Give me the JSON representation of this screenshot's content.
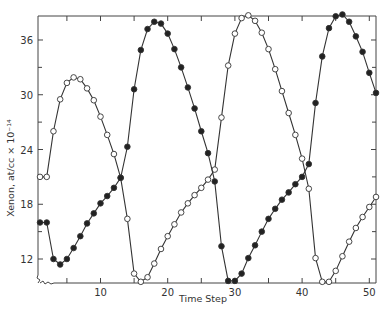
{
  "chart_data": {
    "type": "line",
    "title": "",
    "xlabel": "Time Step",
    "ylabel": "Xenon, at/cc × 10⁻¹⁴",
    "xlim": [
      0.7,
      51
    ],
    "ylim": [
      9.37,
      38.63
    ],
    "x_ticks": [
      10,
      20,
      30,
      40,
      50
    ],
    "x_minor_ticks": [
      5,
      15,
      25,
      35,
      45
    ],
    "y_ticks": [
      12,
      18,
      24,
      30,
      36
    ],
    "y_minor_ticks": [
      15,
      21,
      27,
      33
    ],
    "grid": false,
    "legend": null,
    "axis_break_marker": true,
    "x": [
      1,
      2,
      3,
      4,
      5,
      6,
      7,
      8,
      9,
      10,
      11,
      12,
      13,
      14,
      15,
      16,
      17,
      18,
      19,
      20,
      21,
      22,
      23,
      24,
      25,
      26,
      27,
      28,
      29,
      30,
      31,
      32,
      33,
      34,
      35,
      36,
      37,
      38,
      39,
      40,
      41,
      42,
      43,
      44,
      45,
      46,
      47,
      48,
      49,
      50,
      51
    ],
    "series": [
      {
        "name": "open circles",
        "marker": "open-circle",
        "values": [
          21.0,
          21.0,
          26.0,
          29.5,
          31.3,
          31.9,
          31.7,
          30.7,
          29.4,
          27.6,
          25.6,
          23.5,
          20.9,
          16.4,
          10.4,
          9.5,
          10.0,
          11.5,
          13.1,
          14.5,
          15.8,
          17.1,
          18.1,
          19.0,
          19.8,
          20.7,
          21.8,
          27.5,
          33.2,
          36.7,
          38.4,
          38.7,
          38.1,
          36.8,
          35.0,
          32.8,
          30.4,
          28.0,
          25.6,
          23.0,
          19.7,
          12.1,
          9.5,
          9.5,
          10.7,
          12.3,
          13.9,
          15.4,
          16.6,
          17.7,
          18.8
        ]
      },
      {
        "name": "filled circles",
        "marker": "filled-circle",
        "values": [
          16.0,
          16.0,
          12.0,
          11.4,
          12.0,
          13.2,
          14.5,
          15.9,
          17.0,
          18.1,
          18.9,
          19.8,
          20.9,
          24.3,
          30.6,
          34.9,
          37.2,
          38.0,
          37.8,
          36.7,
          35.0,
          33.0,
          30.8,
          28.5,
          26.0,
          23.6,
          20.5,
          13.4,
          9.6,
          9.6,
          10.4,
          12.1,
          13.5,
          15.0,
          16.4,
          17.5,
          18.5,
          19.3,
          20.2,
          21.0,
          22.4,
          29.1,
          34.2,
          37.3,
          38.6,
          38.8,
          38.0,
          36.4,
          34.7,
          32.4,
          30.2
        ]
      }
    ]
  },
  "caption": ""
}
